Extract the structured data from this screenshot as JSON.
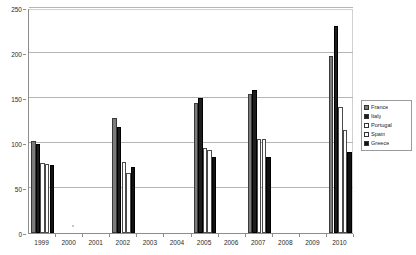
{
  "chart_data": {
    "type": "bar",
    "title": "",
    "xlabel": "",
    "ylabel": "",
    "ylim": [
      0,
      250
    ],
    "yticks": [
      0,
      50,
      100,
      150,
      200,
      250
    ],
    "grid": true,
    "legend_position": "right",
    "categories": [
      "1999",
      "2000",
      "2001",
      "2002",
      "2003",
      "2004",
      "2005",
      "2006",
      "2007",
      "2008",
      "2009",
      "2010"
    ],
    "series": [
      {
        "name": "France",
        "color": "#7c7c7c",
        "values": [
          102,
          null,
          null,
          128,
          null,
          null,
          145,
          null,
          155,
          null,
          null,
          197
        ]
      },
      {
        "name": "Italy",
        "color": "#1d1d1d",
        "values": [
          99,
          null,
          null,
          118,
          null,
          null,
          150,
          null,
          159,
          null,
          null,
          230
        ]
      },
      {
        "name": "Portugal",
        "color": "#ffffff",
        "values": [
          78,
          null,
          null,
          79,
          null,
          null,
          94,
          null,
          104,
          null,
          null,
          140
        ]
      },
      {
        "name": "Spain",
        "color": "#fdfdfd",
        "values": [
          77,
          null,
          null,
          67,
          null,
          null,
          92,
          null,
          104,
          null,
          null,
          115
        ]
      },
      {
        "name": "Greece",
        "color": "#111111",
        "values": [
          76,
          null,
          null,
          73,
          null,
          null,
          85,
          null,
          85,
          null,
          null,
          90
        ]
      }
    ]
  },
  "legend": {
    "items": [
      {
        "label": "France"
      },
      {
        "label": "Italy"
      },
      {
        "label": "Portugal"
      },
      {
        "label": "Spain"
      },
      {
        "label": "Greece"
      }
    ]
  },
  "axes": {
    "y_tick_labels": [
      "250",
      "200",
      "150",
      "100",
      "50",
      "0"
    ],
    "x_tick_labels": [
      "1999",
      "2000",
      "2001",
      "2002",
      "2003",
      "2004",
      "2005",
      "2006",
      "2007",
      "2008",
      "2009",
      "2010"
    ]
  },
  "title_sliver": ""
}
